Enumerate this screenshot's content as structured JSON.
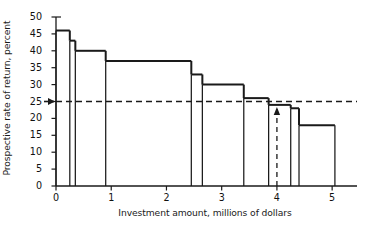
{
  "chart_data": {
    "type": "bar",
    "title": "",
    "subtitle": "",
    "xlabel": "Investment amount, millions of dollars",
    "ylabel": "Prospective rate of return, percent",
    "xlim": [
      0,
      5.45
    ],
    "ylim": [
      0,
      50
    ],
    "xticks": [
      0,
      1,
      2,
      3,
      4,
      5
    ],
    "xtick_labels": [
      "0",
      "1",
      "2",
      "3",
      "4",
      "5"
    ],
    "yticks": [
      0,
      5,
      10,
      15,
      20,
      25,
      30,
      35,
      40,
      45,
      50
    ],
    "ytick_labels": [
      "0",
      "5",
      "10",
      "15",
      "20",
      "25",
      "30",
      "35",
      "40",
      "45",
      "50"
    ],
    "grid": false,
    "legend": null,
    "series": [
      {
        "name": "Investment demand schedule",
        "step_kind": "post",
        "steps": [
          {
            "x_start": 0.0,
            "x_end": 0.25,
            "value": 46
          },
          {
            "x_start": 0.25,
            "x_end": 0.35,
            "value": 43
          },
          {
            "x_start": 0.35,
            "x_end": 0.9,
            "value": 40
          },
          {
            "x_start": 0.9,
            "x_end": 2.45,
            "value": 37
          },
          {
            "x_start": 2.45,
            "x_end": 2.65,
            "value": 33
          },
          {
            "x_start": 2.65,
            "x_end": 3.4,
            "value": 30
          },
          {
            "x_start": 3.4,
            "x_end": 3.85,
            "value": 26
          },
          {
            "x_start": 3.85,
            "x_end": 4.25,
            "value": 24
          },
          {
            "x_start": 4.25,
            "x_end": 4.4,
            "value": 23
          },
          {
            "x_start": 4.4,
            "x_end": 5.05,
            "value": 18
          }
        ]
      }
    ],
    "annotations": [
      {
        "kind": "horizontal-dashed-line",
        "name": "cost-of-capital-line",
        "y": 25,
        "x_start": 0.0,
        "x_end": 5.45,
        "label": ""
      },
      {
        "kind": "vertical-dashed-line",
        "name": "equilibrium-investment-line",
        "x": 4.0,
        "y_start": 0,
        "y_end": 24,
        "label": ""
      },
      {
        "kind": "arrow-up",
        "name": "equilibrium-investment-arrow",
        "x": 4.0,
        "y": 24,
        "label": ""
      },
      {
        "kind": "arrow-right",
        "name": "cost-of-capital-arrow",
        "x": 0.0,
        "y": 25,
        "label": ""
      }
    ],
    "colors": {
      "line": "#1a1a1a",
      "axis": "#1a1a1a",
      "dashed": "#1a1a1a",
      "background": "#ffffff"
    }
  }
}
